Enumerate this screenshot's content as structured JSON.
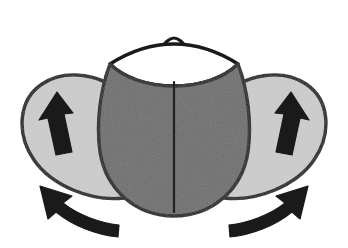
{
  "figure": {
    "title": "Beetle with elytra raised and hind wings unfolding",
    "caption": "",
    "width": 348,
    "height": 248,
    "background_color": "#ffffff"
  },
  "colors": {
    "background": "#ffffff",
    "body_fill": "#6e6e6e",
    "wing_fill": "#cdcdcd",
    "pronotum_fill": "#ffffff",
    "outline": "#1a1a1a",
    "arrow_fill": "#1a1a1a",
    "midline": "#222222"
  },
  "parts": [
    {
      "id": "head",
      "label": "head",
      "description": "Small triangular peak at top center of the insect",
      "fill": "#ffffff",
      "stroke": "#1a1a1a"
    },
    {
      "id": "pronotum",
      "label": "pronotum",
      "description": "White lens-shaped plate behind the head spanning the shoulders",
      "fill": "#ffffff",
      "stroke": "#1a1a1a"
    },
    {
      "id": "elytra",
      "label": "elytra",
      "description": "Large dark gray rounded wing covers forming the oval body, split by a central suture line",
      "fill": "#6e6e6e",
      "stroke": "#1a1a1a"
    },
    {
      "id": "elytral-suture",
      "label": "elytral suture",
      "description": "Vertical dividing line down the middle of the elytra",
      "stroke": "#222222"
    },
    {
      "id": "hind-wing-left",
      "label": "left hind wing",
      "description": "Light gray teardrop-shaped membranous wing extending out to the left",
      "fill": "#cdcdcd",
      "stroke": "#1a1a1a"
    },
    {
      "id": "hind-wing-right",
      "label": "right hind wing",
      "description": "Light gray teardrop-shaped membranous wing extending out to the right",
      "fill": "#cdcdcd",
      "stroke": "#1a1a1a"
    }
  ],
  "annotations": {
    "arrows": [
      {
        "id": "lift-arrow-left",
        "type": "straight",
        "label": "upward lift arrow on left hind wing",
        "direction": "up-right",
        "fill": "#1a1a1a"
      },
      {
        "id": "lift-arrow-right",
        "type": "straight",
        "label": "upward lift arrow on right hind wing",
        "direction": "up-left",
        "fill": "#1a1a1a"
      },
      {
        "id": "sweep-arrow-left",
        "type": "curved",
        "label": "curved sweep arrow below left hind wing",
        "direction": "counter-clockwise outward to upper-left",
        "fill": "#1a1a1a"
      },
      {
        "id": "sweep-arrow-right",
        "type": "curved",
        "label": "curved sweep arrow below right hind wing",
        "direction": "clockwise outward to upper-right",
        "fill": "#1a1a1a"
      }
    ]
  }
}
